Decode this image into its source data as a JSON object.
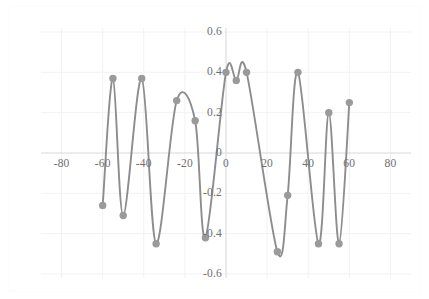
{
  "chart_data": {
    "type": "line",
    "title": "",
    "subtitle": "",
    "xlabel": "",
    "ylabel": "",
    "xlim": [
      -90,
      90
    ],
    "ylim": [
      -0.62,
      0.62
    ],
    "grid": true,
    "legend": null,
    "marker": "circle",
    "line_color": "#8d8d8d",
    "marker_color": "#9a9a9a",
    "grid_color": "#f2f2f5",
    "axis_color": "#d8d8dd",
    "tick_color": "#6f6f6f",
    "background": "#ffffff",
    "xticks": [
      -80,
      -60,
      -40,
      -20,
      0,
      20,
      40,
      60,
      80
    ],
    "xtick_labels": [
      "-80",
      "-60",
      "-40",
      "-20",
      "0",
      "20",
      "40",
      "60",
      "80"
    ],
    "yticks": [
      -0.6,
      -0.4,
      -0.2,
      0,
      0.2,
      0.4,
      0.6
    ],
    "ytick_labels": [
      "-0.6",
      "-0.4",
      "-0.2",
      "0",
      "0.2",
      "0.4",
      "0.6"
    ],
    "x": [
      -60,
      -55,
      -50,
      -41,
      -34,
      -24,
      -15,
      -10,
      0,
      5,
      10,
      25,
      30,
      35,
      45,
      50,
      55,
      60
    ],
    "y": [
      -0.26,
      0.37,
      -0.31,
      0.37,
      -0.45,
      0.26,
      0.16,
      -0.42,
      0.4,
      0.36,
      0.4,
      -0.49,
      -0.21,
      0.4,
      -0.45,
      0.2,
      -0.45,
      0.25
    ],
    "series": [
      {
        "name": "series-1",
        "points": [
          {
            "x": -60,
            "y": -0.26
          },
          {
            "x": -55,
            "y": 0.37
          },
          {
            "x": -50,
            "y": -0.31
          },
          {
            "x": -41,
            "y": 0.37
          },
          {
            "x": -34,
            "y": -0.45
          },
          {
            "x": -24,
            "y": 0.26
          },
          {
            "x": -15,
            "y": 0.16
          },
          {
            "x": -10,
            "y": -0.42
          },
          {
            "x": 0,
            "y": 0.4
          },
          {
            "x": 5,
            "y": 0.36
          },
          {
            "x": 10,
            "y": 0.4
          },
          {
            "x": 25,
            "y": -0.49
          },
          {
            "x": 30,
            "y": -0.21
          },
          {
            "x": 35,
            "y": 0.4
          },
          {
            "x": 45,
            "y": -0.45
          },
          {
            "x": 50,
            "y": 0.2
          },
          {
            "x": 55,
            "y": -0.45
          },
          {
            "x": 60,
            "y": 0.25
          }
        ]
      }
    ]
  }
}
